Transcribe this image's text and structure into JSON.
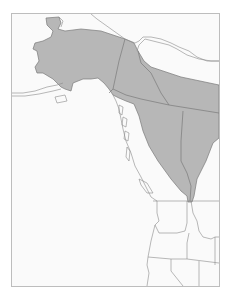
{
  "map": {
    "type": "species range map",
    "region": "Northwestern North America",
    "caption_partial": "· ·",
    "colors": {
      "background": "#fafafa",
      "frame": "#bdbdbd",
      "range_fill": "#b7b7b7",
      "border_line": "#7a7a7a",
      "coast_line": "#8a8a8a"
    },
    "areas": [
      {
        "name": "Alaska",
        "in_range": true
      },
      {
        "name": "Yukon",
        "in_range": true
      },
      {
        "name": "Northwest Territories (southern)",
        "in_range": true
      },
      {
        "name": "British Columbia (interior)",
        "in_range": true
      },
      {
        "name": "Alberta",
        "in_range": true
      },
      {
        "name": "Washington",
        "in_range": false
      },
      {
        "name": "Oregon",
        "in_range": false
      },
      {
        "name": "Idaho",
        "in_range": "northern tip"
      },
      {
        "name": "Montana",
        "in_range": false
      },
      {
        "name": "California",
        "in_range": false
      },
      {
        "name": "Nevada",
        "in_range": false
      }
    ]
  }
}
